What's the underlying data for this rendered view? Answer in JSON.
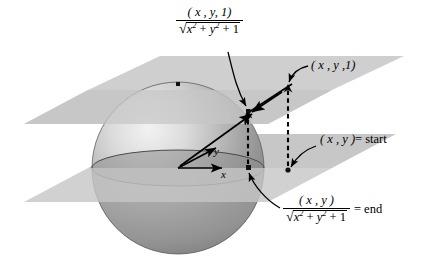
{
  "figure": {
    "background_color": "#ffffff",
    "width": 428,
    "height": 270
  },
  "colors": {
    "plane_fill": "#cccccc",
    "plane_fill_upper": "#cfcfcf",
    "sphere_light": "#f0f0f0",
    "sphere_mid": "#a8a8a8",
    "sphere_dark": "#6f6f6f",
    "equator_band": "#8e8e8e",
    "ink": "#000000"
  },
  "labels": {
    "top_fraction": {
      "numerator": "( x , y, 1)",
      "denominator_radicand": "x² + y² + 1",
      "plain": "(x, y, 1) / √(x² + y² + 1)"
    },
    "point_xy1": {
      "text": "( x , y ,1)",
      "plain": "(x, y, 1)"
    },
    "start": {
      "point": "( x , y )",
      "equals": "= start",
      "plain": "(x, y) = start"
    },
    "end_fraction": {
      "numerator": "( x , y )",
      "denominator_radicand": "x² + y² + 1",
      "equals": "= end",
      "plain": "(x, y) / √(x² + y² + 1) = end"
    }
  },
  "axes": {
    "y_label": "y",
    "x_label": "x",
    "origin": {
      "x": 178,
      "y": 168
    }
  },
  "geometry": {
    "sphere": {
      "cx": 178,
      "cy": 168,
      "r": 86
    },
    "north_pole_dot": {
      "x": 178,
      "y": 84
    },
    "upper_plane_y": 90,
    "lower_plane_y": 168,
    "projected_sphere_point": {
      "x": 248,
      "y": 112
    },
    "start_point": {
      "x": 288,
      "y": 170
    },
    "lifted_point": {
      "x": 288,
      "y": 90
    },
    "end_point": {
      "x": 248,
      "y": 168
    }
  },
  "math_glyphs": {
    "radical": "√",
    "superscript_two": "2"
  }
}
